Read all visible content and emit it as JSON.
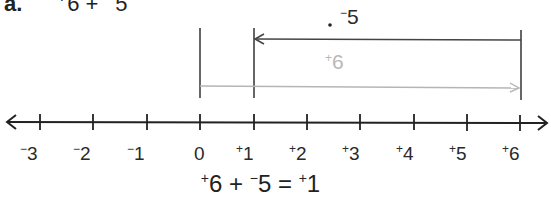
{
  "problem": {
    "label": "a.",
    "expression_sign_a": "+",
    "expression_value_a": "6",
    "expression_op": "+",
    "expression_sign_b": "−",
    "expression_value_b": "5"
  },
  "number_line": {
    "min": -3,
    "max": 6,
    "ticks": [
      {
        "sign": "−",
        "value": "3",
        "x": 40
      },
      {
        "sign": "−",
        "value": "2",
        "x": 93
      },
      {
        "sign": "−",
        "value": "1",
        "x": 147
      },
      {
        "sign": "",
        "value": "0",
        "x": 200
      },
      {
        "sign": "+",
        "value": "1",
        "x": 254
      },
      {
        "sign": "+",
        "value": "2",
        "x": 307
      },
      {
        "sign": "+",
        "value": "3",
        "x": 360
      },
      {
        "sign": "+",
        "value": "4",
        "x": 414
      },
      {
        "sign": "+",
        "value": "5",
        "x": 467
      },
      {
        "sign": "+",
        "value": "6",
        "x": 520
      }
    ]
  },
  "arrows": {
    "first": {
      "sign": "+",
      "value": "6",
      "from": 0,
      "to": 6,
      "color": "#b0b0b0"
    },
    "second": {
      "sign": "−",
      "value": "5",
      "from": 6,
      "to": 1,
      "color": "#333333"
    }
  },
  "equation": {
    "a_sign": "+",
    "a_value": "6",
    "op": "+",
    "b_sign": "−",
    "b_value": "5",
    "eq": "=",
    "result_sign": "+",
    "result_value": "1"
  }
}
